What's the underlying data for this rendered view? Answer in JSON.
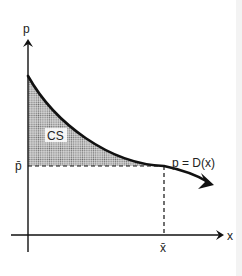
{
  "diagram": {
    "axes": {
      "y_label": "p",
      "x_label": "x"
    },
    "curve_label": "p = D(x)",
    "region_label": "CS",
    "price_mark": "p̄",
    "quantity_mark": "x̄",
    "colors": {
      "ink": "#111111",
      "shading": "#9a9a9a",
      "background": "#ffffff"
    }
  }
}
